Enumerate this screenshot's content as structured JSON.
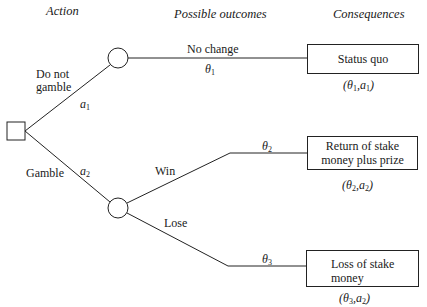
{
  "headers": {
    "action": "Action",
    "outcomes": "Possible outcomes",
    "consequences": "Consequences"
  },
  "actions": [
    {
      "id": "a1",
      "label_line1": "Do not",
      "label_line2": "gamble",
      "symbol": "a",
      "sub": "1"
    },
    {
      "id": "a2",
      "label": "Gamble",
      "symbol": "a",
      "sub": "2"
    }
  ],
  "outcomes": [
    {
      "id": "theta1",
      "label": "No change",
      "symbol": "θ",
      "sub": "1"
    },
    {
      "id": "theta2",
      "label": "Win",
      "symbol": "θ",
      "sub": "2"
    },
    {
      "id": "theta3",
      "label": "Lose",
      "symbol": "θ",
      "sub": "3"
    }
  ],
  "consequences": [
    {
      "text_line1": "Status quo",
      "pair": {
        "theta": "1",
        "a": "1"
      }
    },
    {
      "text_line1": "Return of stake",
      "text_line2": "money plus prize",
      "pair": {
        "theta": "2",
        "a": "2"
      }
    },
    {
      "text_line1": "Loss of stake",
      "text_line2": "money",
      "pair": {
        "theta": "3",
        "a": "2"
      }
    }
  ],
  "colors": {
    "stroke": "#222222",
    "background": "#ffffff"
  }
}
